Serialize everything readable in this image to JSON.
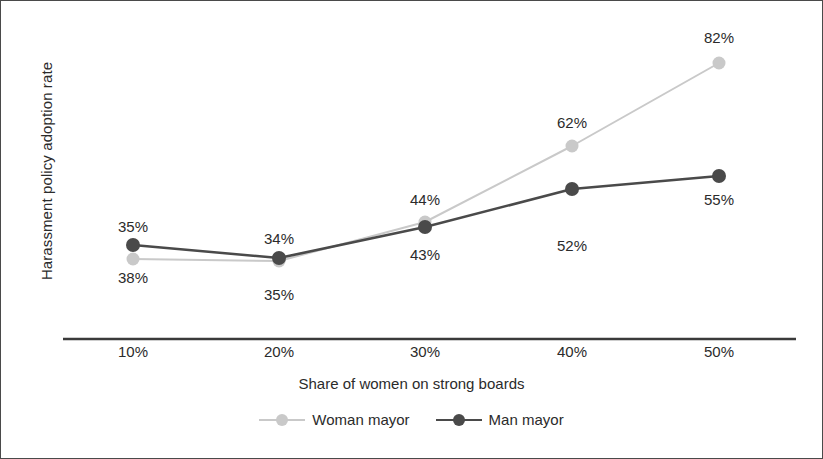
{
  "chart_data": {
    "type": "line",
    "title": "",
    "xlabel": "Share of women on strong boards",
    "ylabel": "Harassment policy adoption rate",
    "categories": [
      "10%",
      "20%",
      "30%",
      "40%",
      "50%"
    ],
    "grid": false,
    "legend_position": "bottom",
    "y_axis_ticks_shown": false,
    "ylim": [
      30,
      90
    ],
    "series": [
      {
        "name": "Woman mayor",
        "color": "#c9c9c9",
        "values": [
          38,
          35,
          43,
          62,
          82
        ],
        "labels": [
          "38%",
          "35%",
          "43%",
          "62%",
          "82%"
        ],
        "label_positions": [
          "below",
          "below",
          "below",
          "above",
          "above"
        ],
        "points_px": [
          {
            "x": 132,
            "y": 258
          },
          {
            "x": 278,
            "y": 260
          },
          {
            "x": 424,
            "y": 221
          },
          {
            "x": 571,
            "y": 145
          },
          {
            "x": 718,
            "y": 62
          }
        ],
        "label_px": [
          {
            "x": 132,
            "y": 268
          },
          {
            "x": 278,
            "y": 285
          },
          {
            "x": 424,
            "y": 245
          },
          {
            "x": 571,
            "y": 113
          },
          {
            "x": 718,
            "y": 28
          }
        ]
      },
      {
        "name": "Man mayor",
        "color": "#4a4a4a",
        "values": [
          35,
          34,
          44,
          52,
          55
        ],
        "labels": [
          "35%",
          "34%",
          "44%",
          "52%",
          "55%"
        ],
        "label_positions": [
          "above",
          "above",
          "above",
          "below",
          "below"
        ],
        "points_px": [
          {
            "x": 132,
            "y": 244
          },
          {
            "x": 278,
            "y": 257
          },
          {
            "x": 424,
            "y": 226
          },
          {
            "x": 571,
            "y": 188
          },
          {
            "x": 718,
            "y": 175
          }
        ],
        "label_px": [
          {
            "x": 132,
            "y": 217
          },
          {
            "x": 278,
            "y": 229
          },
          {
            "x": 424,
            "y": 190
          },
          {
            "x": 571,
            "y": 236
          },
          {
            "x": 718,
            "y": 190
          }
        ]
      }
    ],
    "x_tick_px": [
      132,
      278,
      424,
      571,
      718
    ],
    "axis_line_px": {
      "x1": 62,
      "x2": 795,
      "y": 338
    }
  },
  "legend": {
    "items": [
      {
        "label": "Woman mayor",
        "color": "#c9c9c9"
      },
      {
        "label": "Man mayor",
        "color": "#4a4a4a"
      }
    ]
  },
  "colors": {
    "woman_mayor": "#c9c9c9",
    "man_mayor": "#4a4a4a",
    "axis": "#3a3a3a",
    "text": "#2b2b2b",
    "border": "#4a4a4a",
    "background": "#ffffff"
  }
}
